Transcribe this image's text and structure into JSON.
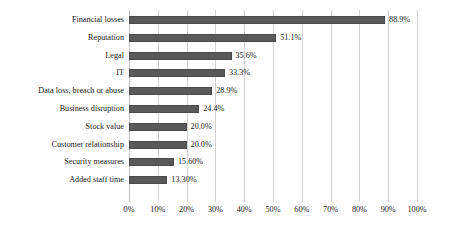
{
  "chart_data": {
    "type": "bar",
    "orientation": "horizontal",
    "title": "",
    "subtitle": "",
    "xlabel": "",
    "ylabel": "",
    "xlim": [
      0,
      100
    ],
    "grid": true,
    "legend": false,
    "legend_position": "none",
    "bar_color": "#595959",
    "bar_border_color": "#4a4a4a",
    "gridline_color": "#d2d2d2",
    "text_color": "#1a1a1a",
    "background_color": "#ffffff",
    "xticks": [
      "0%",
      "10%",
      "20%",
      "30%",
      "40%",
      "50%",
      "60%",
      "70%",
      "80%",
      "90%",
      "100%"
    ],
    "xtick_values": [
      0,
      10,
      20,
      30,
      40,
      50,
      60,
      70,
      80,
      90,
      100
    ],
    "categories": [
      "Financial losses",
      "Reputation",
      "Legal",
      "IT",
      "Data loss, breach or abuse",
      "Business disruption",
      "Stock value",
      "Customer relationship",
      "Security measures",
      "Added staff time"
    ],
    "values": [
      88.9,
      51.1,
      35.6,
      33.3,
      28.9,
      24.4,
      20.0,
      20.0,
      15.6,
      13.3
    ],
    "value_labels": [
      "88.9%",
      "51.1%",
      "35.6%",
      "33.3%",
      "28.9%",
      "24.4%",
      "20.0%",
      "20.0%",
      "15.60%",
      "13.30%"
    ]
  }
}
